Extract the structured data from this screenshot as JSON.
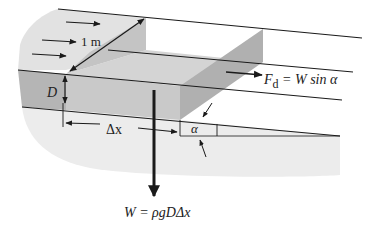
{
  "figure": {
    "type": "physics-diagram",
    "labels": {
      "width": "1 m",
      "depth": "D",
      "length": "Δx",
      "angle": "α",
      "drag_force_symbol": "F",
      "drag_force_sub": "d",
      "drag_force_eq": " = W sin α",
      "weight_eq": "W = ρgDΔx"
    },
    "flow_arrows_count": 3,
    "colors": {
      "line": "#1a1a1a",
      "fluid_light": "#e6e6e6",
      "fluid_mid": "#cfcfcf",
      "block_face": "#bdbdbd",
      "block_dark": "#a8a8a8",
      "ground": "#ececec"
    }
  }
}
